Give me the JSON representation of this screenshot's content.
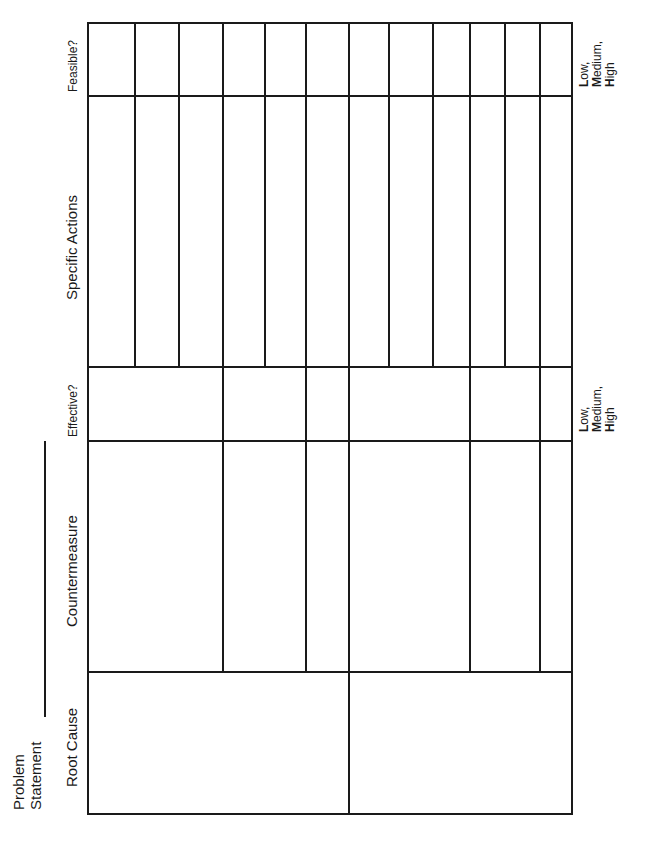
{
  "document": {
    "orientation": "rotated-90-ccw",
    "title_fragment": ""
  },
  "problem_statement": {
    "label_line1": "Problem",
    "label_line2": "Statement",
    "value": ""
  },
  "columns": [
    {
      "id": "root_cause",
      "label": "Root Cause"
    },
    {
      "id": "countermeasure",
      "label": "Countermeasure"
    },
    {
      "id": "effective",
      "label": "Effective?"
    },
    {
      "id": "specific_actions",
      "label": "Specific Actions"
    },
    {
      "id": "feasible",
      "label": "Feasible?"
    }
  ],
  "rating_scales": {
    "effective": {
      "low": "Low,",
      "medium": "Medium,",
      "high": "High",
      "low_initial": "L",
      "low_rest": "ow,",
      "medium_initial": "M",
      "medium_rest": "edium,",
      "high_initial": "H",
      "high_rest": "igh"
    },
    "feasible": {
      "low": "Low,",
      "medium": "Medium,",
      "high": "High",
      "low_initial": "L",
      "low_rest": "ow,",
      "medium_initial": "M",
      "medium_rest": "edium,",
      "high_initial": "H",
      "high_rest": "igh"
    }
  },
  "grid": {
    "root_causes": 2,
    "countermeasures": 6,
    "specific_actions": 12,
    "cells": "blank"
  }
}
